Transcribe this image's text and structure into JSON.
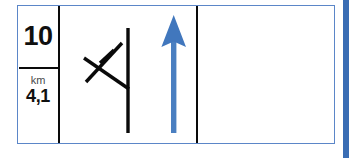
{
  "sign": {
    "name": "road-direction-sign",
    "border_color": "#5b86c8",
    "background_color": "#ffffff",
    "line_color": "#0a0a0a",
    "arrow_color": "#4a7fc1",
    "distance_cell": {
      "route_number": "10",
      "unit_label": "km",
      "distance_value": "4,1"
    },
    "junction_cell": {
      "symbol_name": "crossed-out-side-road-junction",
      "arrow_name": "straight-ahead-arrow",
      "arrow_direction": "up"
    },
    "empty_cell": {
      "content": ""
    }
  },
  "right_bar": {
    "name": "right-edge-blue-bar",
    "color": "#3a6db4"
  }
}
